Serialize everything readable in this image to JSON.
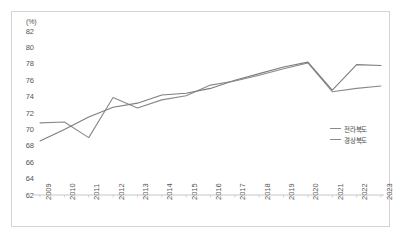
{
  "chart_data": {
    "type": "line",
    "title": "",
    "xlabel": "",
    "ylabel": "",
    "yunit": "(%)",
    "ylim": [
      62,
      82
    ],
    "ytick_step": 2,
    "yticks": [
      "82",
      "80",
      "78",
      "76",
      "74",
      "72",
      "70",
      "68",
      "66",
      "64",
      "62"
    ],
    "grid": false,
    "legend_position": "right-middle",
    "categories": [
      "2009",
      "2010",
      "2011",
      "2012",
      "2013",
      "2014",
      "2015",
      "2016",
      "2017",
      "2018",
      "2019",
      "2020",
      "2021",
      "2022",
      "2023"
    ],
    "series": [
      {
        "name": "전라북도",
        "color": "#8a8a8a",
        "values": [
          70.8,
          70.9,
          69.0,
          73.9,
          72.6,
          73.6,
          74.1,
          75.4,
          75.9,
          76.6,
          77.4,
          78.1,
          74.6,
          75.0,
          75.3
        ]
      },
      {
        "name": "경상북도",
        "color": "#7d7d7d",
        "values": [
          68.6,
          70.0,
          71.5,
          72.7,
          73.2,
          74.2,
          74.4,
          75.0,
          76.0,
          76.8,
          77.6,
          78.2,
          74.8,
          77.9,
          77.8
        ]
      }
    ]
  },
  "legend": {
    "items": [
      {
        "label": "전라북도"
      },
      {
        "label": "경상북도"
      }
    ]
  }
}
